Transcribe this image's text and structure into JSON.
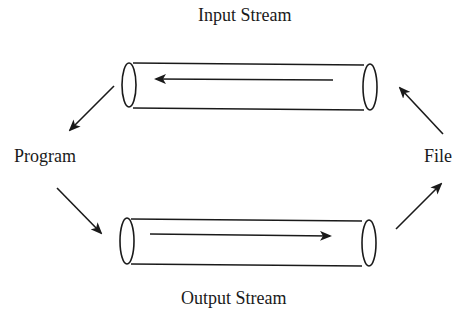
{
  "diagram": {
    "nodes": {
      "program": {
        "label": "Program"
      },
      "file": {
        "label": "File"
      }
    },
    "streams": {
      "input": {
        "label": "Input Stream",
        "direction": "file-to-program"
      },
      "output": {
        "label": "Output Stream",
        "direction": "program-to-file"
      }
    },
    "edges": [
      {
        "from": "File",
        "to": "Input Stream"
      },
      {
        "from": "Input Stream",
        "to": "Program"
      },
      {
        "from": "Program",
        "to": "Output Stream"
      },
      {
        "from": "Output Stream",
        "to": "File"
      }
    ],
    "colors": {
      "stroke": "#1a1a1a",
      "background": "#ffffff",
      "text": "#1a1a1a"
    }
  }
}
